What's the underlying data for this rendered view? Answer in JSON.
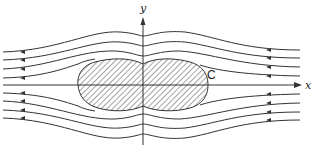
{
  "figure": {
    "type": "flow-streamlines-around-body",
    "axes": {
      "x_label": "x",
      "y_label": "y"
    },
    "body": {
      "label": "C",
      "fill": "hatched",
      "shape": "peanut / double-lobed oval"
    },
    "streamlines": {
      "count_above_axis": 4,
      "count_below_axis": 4,
      "along_axis": 1,
      "flow_direction": "right-to-left",
      "arrow_positions": [
        "left end",
        "right end"
      ]
    },
    "colors": {
      "line": "#333333",
      "hatch": "#555555",
      "background": "#ffffff"
    }
  }
}
